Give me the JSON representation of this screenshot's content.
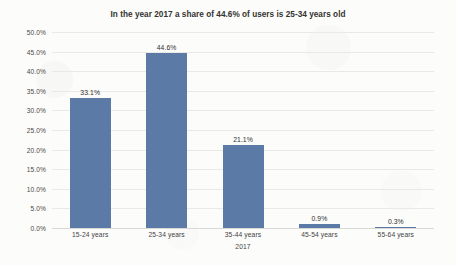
{
  "chart_data": {
    "type": "bar",
    "title": "In the year 2017 a share of 44.6% of users is 25-34 years old",
    "xlabel": "2017",
    "ylabel": "",
    "categories": [
      "15-24 years",
      "25-34 years",
      "35-44 years",
      "45-54 years",
      "55-64 years"
    ],
    "values": [
      33.1,
      44.6,
      21.1,
      0.9,
      0.3
    ],
    "data_labels": [
      "33.1%",
      "44.6%",
      "21.1%",
      "0.9%",
      "0.3%"
    ],
    "ylim": [
      0,
      50
    ],
    "ytick_labels": [
      "50.0%",
      "45.0%",
      "40.0%",
      "35.0%",
      "30.0%",
      "25.0%",
      "20.0%",
      "15.0%",
      "10.0%",
      "5.0%",
      "0.0%"
    ],
    "ytick_values": [
      50,
      45,
      40,
      35,
      30,
      25,
      20,
      15,
      10,
      5,
      0
    ],
    "grid": true,
    "legend": false,
    "series_color": "#5b7ba6",
    "background_color": "#fcfcfb"
  }
}
